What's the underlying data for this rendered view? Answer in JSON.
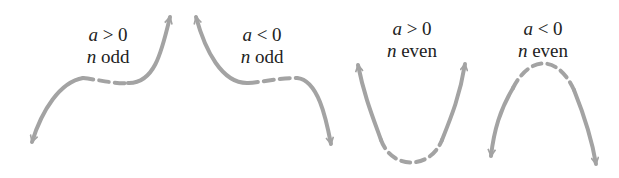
{
  "diagram": {
    "curve_color": "#a3a3a3",
    "panels": [
      {
        "id": "a-pos-n-odd",
        "line1_var": "a",
        "line1_rest": " > 0",
        "line2_var": "n",
        "line2_rest": " odd"
      },
      {
        "id": "a-neg-n-odd",
        "line1_var": "a",
        "line1_rest": " < 0",
        "line2_var": "n",
        "line2_rest": " odd"
      },
      {
        "id": "a-pos-n-even",
        "line1_var": "a",
        "line1_rest": " > 0",
        "line2_var": "n",
        "line2_rest": " even"
      },
      {
        "id": "a-neg-n-even",
        "line1_var": "a",
        "line1_rest": " < 0",
        "line2_var": "n",
        "line2_rest": " even"
      }
    ]
  }
}
